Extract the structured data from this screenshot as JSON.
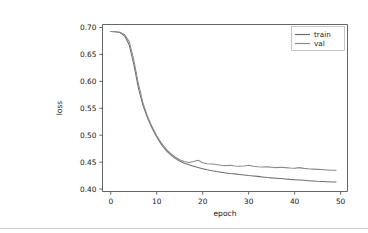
{
  "output_cell": {
    "icon_name": "open-in-new-icon"
  },
  "chart_data": {
    "type": "line",
    "title": "",
    "xlabel": "epoch",
    "ylabel": "loss",
    "xlim": [
      -1.8,
      51.5
    ],
    "ylim": [
      0.3955,
      0.7055
    ],
    "xticks": [
      0,
      10,
      20,
      30,
      40,
      50
    ],
    "xtick_labels": [
      "0",
      "10",
      "20",
      "30",
      "40",
      "50"
    ],
    "yticks": [
      0.4,
      0.45,
      0.5,
      0.55,
      0.6,
      0.65,
      0.7
    ],
    "ytick_labels": [
      "0.40",
      "0.45",
      "0.50",
      "0.55",
      "0.60",
      "0.65",
      "0.70"
    ],
    "grid": false,
    "legend_position": "upper right",
    "legend_entries": [
      "train",
      "val"
    ],
    "colors": {
      "train": "#6e6e6e",
      "val": "#8a8a8a",
      "axis": "#545454",
      "text": "#1a1a1a",
      "background": "#ffffff"
    },
    "x": [
      0,
      1,
      2,
      3,
      4,
      5,
      6,
      7,
      8,
      9,
      10,
      11,
      12,
      13,
      14,
      15,
      16,
      17,
      18,
      19,
      20,
      21,
      22,
      23,
      24,
      25,
      26,
      27,
      28,
      29,
      30,
      31,
      32,
      33,
      34,
      35,
      36,
      37,
      38,
      39,
      40,
      41,
      42,
      43,
      44,
      45,
      46,
      47,
      48,
      49
    ],
    "series": [
      {
        "name": "train",
        "values": [
          0.6925,
          0.692,
          0.6905,
          0.6845,
          0.668,
          0.632,
          0.588,
          0.5555,
          0.532,
          0.513,
          0.4965,
          0.483,
          0.472,
          0.464,
          0.457,
          0.452,
          0.448,
          0.445,
          0.4425,
          0.44,
          0.4378,
          0.4358,
          0.434,
          0.4325,
          0.4312,
          0.43,
          0.429,
          0.4282,
          0.4272,
          0.4262,
          0.4252,
          0.4244,
          0.4236,
          0.4226,
          0.4216,
          0.4208,
          0.4202,
          0.4196,
          0.4188,
          0.418,
          0.4174,
          0.4168,
          0.4162,
          0.4156,
          0.415,
          0.4144,
          0.414,
          0.4136,
          0.4132,
          0.413
        ]
      },
      {
        "name": "val",
        "values": [
          0.6925,
          0.6922,
          0.6912,
          0.687,
          0.674,
          0.64,
          0.596,
          0.56,
          0.535,
          0.5155,
          0.499,
          0.4855,
          0.4745,
          0.466,
          0.4595,
          0.4545,
          0.451,
          0.4495,
          0.4512,
          0.4535,
          0.449,
          0.447,
          0.4465,
          0.4455,
          0.4442,
          0.4435,
          0.4442,
          0.443,
          0.4422,
          0.4428,
          0.4444,
          0.4425,
          0.4416,
          0.441,
          0.4412,
          0.4404,
          0.4398,
          0.4406,
          0.4398,
          0.439,
          0.4388,
          0.4398,
          0.4384,
          0.4376,
          0.437,
          0.4366,
          0.4362,
          0.4356,
          0.435,
          0.4348
        ]
      }
    ]
  }
}
